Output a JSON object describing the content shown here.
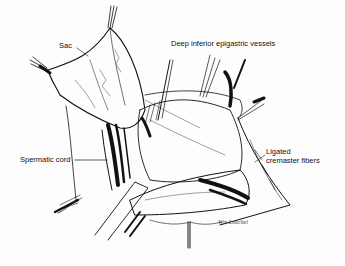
{
  "figure": {
    "type": "surgical-anatomy-illustration",
    "style": "black-and-white line drawing",
    "labels": [
      {
        "id": "sac",
        "text": "Sac"
      },
      {
        "id": "deep-inferior-epigastric-vessels",
        "text": "Deep inferior epigastric vessels"
      },
      {
        "id": "spermatic-cord",
        "text": "Spermatic cord"
      },
      {
        "id": "ligated-cremaster-fibers",
        "text": "Ligated cremaster fibers",
        "lines": [
          "Ligated",
          "cremaster fibers"
        ]
      }
    ],
    "signature": "Wm Loechel",
    "colors": {
      "ink": "#111111",
      "paper": "#fdfdfd"
    }
  }
}
